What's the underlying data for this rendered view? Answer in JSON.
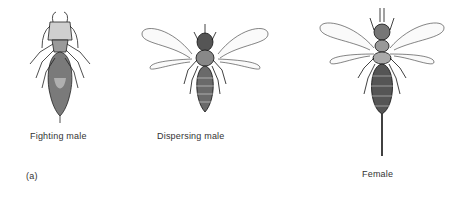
{
  "figure": {
    "panel_label": "(a)",
    "specimens": [
      {
        "id": "fighting-male",
        "label": "Fighting male",
        "winged": false
      },
      {
        "id": "dispersing-male",
        "label": "Dispersing male",
        "winged": true
      },
      {
        "id": "female",
        "label": "Female",
        "winged": true,
        "ovipositor": true
      }
    ]
  }
}
